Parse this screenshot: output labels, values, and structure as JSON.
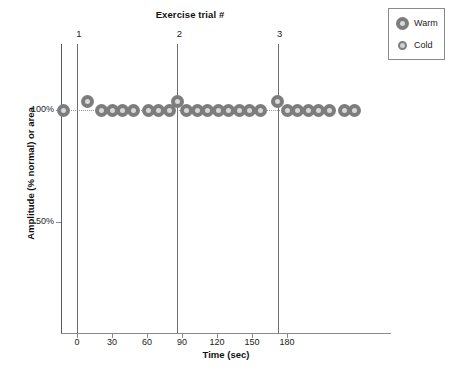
{
  "chart_data": {
    "type": "scatter",
    "title": "Exercise trial #",
    "xlabel": "Time (sec)",
    "ylabel": "Amplitude (% normal) or area",
    "xlim": [
      -14,
      200
    ],
    "ylim": [
      0,
      125
    ],
    "grid": false,
    "xticks": [
      0,
      30,
      60,
      90,
      120,
      150,
      180
    ],
    "xtick_labels": [
      "0",
      "30",
      "60",
      "90",
      "120",
      "150",
      "180"
    ],
    "yticks": [
      50,
      100
    ],
    "ytick_labels": [
      "50%",
      "100%"
    ],
    "reference_line": {
      "y": 100,
      "style": "dotted",
      "label": "100% baseline"
    },
    "trial_markers": [
      {
        "label": "1",
        "x": 0
      },
      {
        "label": "2",
        "x": 86
      },
      {
        "label": "3",
        "x": 172
      }
    ],
    "legend": {
      "position": "top-right",
      "entries": [
        {
          "name": "Warm",
          "marker": "large-open-circle",
          "color": "#7d7d7d"
        },
        {
          "name": "Cold",
          "marker": "small-open-circle",
          "color": "#7d7d7d"
        }
      ]
    },
    "series": [
      {
        "name": "Warm",
        "marker": "large-open-circle",
        "points": [
          {
            "x": -12,
            "y": 100
          },
          {
            "x": 9,
            "y": 104
          },
          {
            "x": 21,
            "y": 100
          },
          {
            "x": 30,
            "y": 100
          },
          {
            "x": 39,
            "y": 100
          },
          {
            "x": 48,
            "y": 100
          },
          {
            "x": 61,
            "y": 100
          },
          {
            "x": 70,
            "y": 100
          },
          {
            "x": 79,
            "y": 100
          },
          {
            "x": 86,
            "y": 104
          },
          {
            "x": 94,
            "y": 100
          },
          {
            "x": 103,
            "y": 100
          },
          {
            "x": 112,
            "y": 100
          },
          {
            "x": 121,
            "y": 100
          },
          {
            "x": 130,
            "y": 100
          },
          {
            "x": 139,
            "y": 100
          },
          {
            "x": 148,
            "y": 100
          },
          {
            "x": 157,
            "y": 100
          },
          {
            "x": 172,
            "y": 104
          },
          {
            "x": 180,
            "y": 100
          },
          {
            "x": 189,
            "y": 100
          },
          {
            "x": 198,
            "y": 100
          },
          {
            "x": 207,
            "y": 100
          },
          {
            "x": 216,
            "y": 100
          },
          {
            "x": 229,
            "y": 100
          },
          {
            "x": 238,
            "y": 100
          }
        ]
      }
    ]
  },
  "legend_box": {
    "rows": [
      {
        "label": "Warm",
        "marker_class": "warm"
      },
      {
        "label": "Cold",
        "marker_class": "cold"
      }
    ]
  }
}
